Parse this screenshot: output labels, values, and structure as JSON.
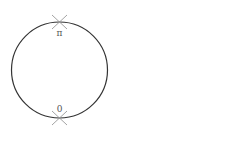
{
  "diagram": {
    "type": "circle-with-marked-points",
    "circle": {
      "cx": 59.5,
      "cy": 70,
      "r": 48,
      "stroke": "#333333"
    },
    "points": [
      {
        "id": "top",
        "label": "π",
        "x": 59.5,
        "y": 22,
        "label_x": 59.5,
        "label_y": 34
      },
      {
        "id": "bottom",
        "label": "0",
        "x": 59.5,
        "y": 118,
        "label_x": 59.5,
        "label_y": 112
      }
    ],
    "marker_color": "#999999"
  }
}
